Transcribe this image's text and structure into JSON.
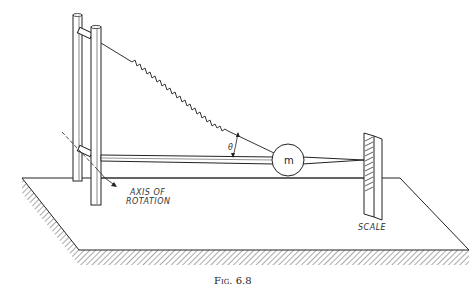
{
  "figure": {
    "caption": "Fig. 6.8",
    "labels": {
      "axis_line1": "AXIS OF",
      "axis_line2": "ROTATION",
      "scale": "SCALE",
      "mass": "m",
      "angle": "θ"
    },
    "components": [
      "base-platform",
      "vertical-post-back",
      "vertical-post-front",
      "spring",
      "horizontal-beam",
      "mass-ball",
      "scale",
      "axis-of-rotation-line"
    ]
  }
}
